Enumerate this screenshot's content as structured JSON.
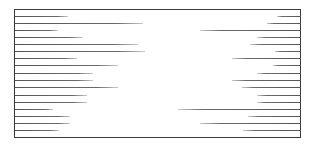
{
  "figure": {
    "type": "bidirectional-line-diagram",
    "frame": {
      "left": 14,
      "top": 9,
      "right": 301,
      "bottom": 138,
      "stroke": "#3a3a3a"
    },
    "line_color": "#5a5a5a",
    "rows": [
      {
        "y": 16,
        "left_end": 68,
        "right_start": 277
      },
      {
        "y": 23,
        "left_end": 143,
        "right_start": 267
      },
      {
        "y": 30,
        "left_end": 58,
        "right_start": 200
      },
      {
        "y": 37,
        "left_end": 83,
        "right_start": 257
      },
      {
        "y": 44,
        "left_end": 138,
        "right_start": 250
      },
      {
        "y": 51,
        "left_end": 145,
        "right_start": 275
      },
      {
        "y": 58,
        "left_end": 77,
        "right_start": 232
      },
      {
        "y": 65,
        "left_end": 118,
        "right_start": 273
      },
      {
        "y": 73,
        "left_end": 93,
        "right_start": 257
      },
      {
        "y": 80,
        "left_end": 93,
        "right_start": 232
      },
      {
        "y": 87,
        "left_end": 118,
        "right_start": 242
      },
      {
        "y": 95,
        "left_end": 87,
        "right_start": 257
      },
      {
        "y": 102,
        "left_end": 87,
        "right_start": 257
      },
      {
        "y": 109,
        "left_end": 53,
        "right_start": 178
      },
      {
        "y": 116,
        "left_end": 70,
        "right_start": 248
      },
      {
        "y": 123,
        "left_end": 70,
        "right_start": 200
      },
      {
        "y": 130,
        "left_end": 59,
        "right_start": 243
      }
    ]
  }
}
